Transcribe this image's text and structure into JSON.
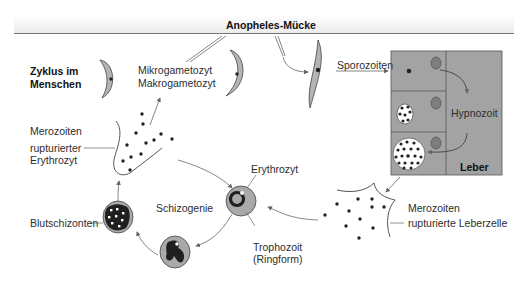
{
  "diagram": {
    "title": "Anopheles-Mücke",
    "cycle_label": [
      "Zyklus im",
      "Menschen"
    ],
    "labels": {
      "gametocytes": [
        "Mikrogametozyt",
        "Makrogametozyt"
      ],
      "sporozoites": "Sporozoiten",
      "hypnozoite": "Hypnozoit",
      "liver": "Leber",
      "merozoites_liver": "Merozoiten",
      "ruptured_liver_cell": "rupturierte Leberzelle",
      "merozoites_blood": "Merozoiten",
      "ruptured_erythrocyte": [
        "rupturierter",
        "Erythrozyt"
      ],
      "erythrocyte": "Erythrozyt",
      "schizogony": "Schizogenie",
      "trophozoite": [
        "Trophozoit",
        "(Ringform)"
      ],
      "blood_schizonts": "Blutschizonten"
    },
    "colors": {
      "cell_gray": "#a9a9a9",
      "liver_gray": "#a3a3a3",
      "parasite_dark": "#222222",
      "nucleus_gray": "#7d7d7d",
      "line": "#6a6a6a"
    }
  }
}
